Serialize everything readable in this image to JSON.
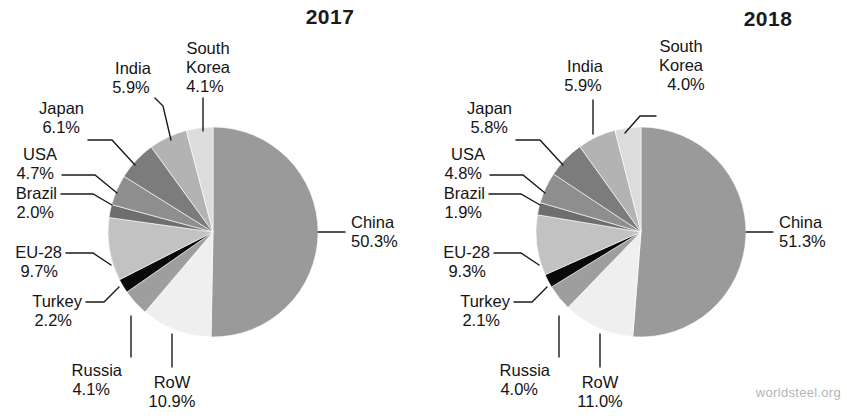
{
  "watermark": "worldsteel.org",
  "chart_data": [
    {
      "type": "pie",
      "title": "2017",
      "labels": [
        "China",
        "RoW",
        "Russia",
        "Turkey",
        "EU-28",
        "Brazil",
        "USA",
        "Japan",
        "India",
        "South Korea"
      ],
      "values": [
        50.3,
        10.9,
        4.1,
        2.2,
        9.7,
        2.0,
        4.7,
        6.1,
        5.9,
        4.1
      ],
      "value_labels": [
        "50.3%",
        "10.9%",
        "4.1%",
        "2.2%",
        "9.7%",
        "2.0%",
        "4.7%",
        "6.1%",
        "5.9%",
        "4.1%"
      ],
      "colors": [
        "#9a9a9a",
        "#efefef",
        "#9e9e9e",
        "#0a0a0a",
        "#c2c2c2",
        "#6e6e6e",
        "#8e8e8e",
        "#7c7c7c",
        "#b3b3b3",
        "#dcdcdc"
      ],
      "start_angle": 0,
      "direction": "clockwise",
      "legend": "none",
      "grid": false
    },
    {
      "type": "pie",
      "title": "2018",
      "labels": [
        "China",
        "RoW",
        "Russia",
        "Turkey",
        "EU-28",
        "Brazil",
        "USA",
        "Japan",
        "India",
        "South Korea"
      ],
      "values": [
        51.3,
        11.0,
        4.0,
        2.1,
        9.3,
        1.9,
        4.8,
        5.8,
        5.9,
        4.0
      ],
      "value_labels": [
        "51.3%",
        "11.0%",
        "4.0%",
        "2.1%",
        "9.3%",
        "1.9%",
        "4.8%",
        "5.8%",
        "5.9%",
        "4.0%"
      ],
      "colors": [
        "#9a9a9a",
        "#efefef",
        "#9e9e9e",
        "#0a0a0a",
        "#c2c2c2",
        "#6e6e6e",
        "#8e8e8e",
        "#7c7c7c",
        "#b3b3b3",
        "#dcdcdc"
      ],
      "start_angle": 0,
      "direction": "clockwise",
      "legend": "none",
      "grid": false
    }
  ],
  "left_chart": {
    "title": "2017",
    "labels": {
      "china_name": "China",
      "china_pct": "50.3%",
      "row_name": "RoW",
      "row_pct": "10.9%",
      "russia_name": "Russia",
      "russia_pct": "4.1%",
      "turkey_name": "Turkey",
      "turkey_pct": "2.2%",
      "eu_name": "EU-28",
      "eu_pct": "9.7%",
      "brazil_name": "Brazil",
      "brazil_pct": "2.0%",
      "usa_name": "USA",
      "usa_pct": "4.7%",
      "japan_name": "Japan",
      "japan_pct": "6.1%",
      "india_name": "India",
      "india_pct": "5.9%",
      "korea_name1": "South",
      "korea_name2": "Korea",
      "korea_pct": "4.1%"
    }
  },
  "right_chart": {
    "title": "2018",
    "labels": {
      "china_name": "China",
      "china_pct": "51.3%",
      "row_name": "RoW",
      "row_pct": "11.0%",
      "russia_name": "Russia",
      "russia_pct": "4.0%",
      "turkey_name": "Turkey",
      "turkey_pct": "2.1%",
      "eu_name": "EU-28",
      "eu_pct": "9.3%",
      "brazil_name": "Brazil",
      "brazil_pct": "1.9%",
      "usa_name": "USA",
      "usa_pct": "4.8%",
      "japan_name": "Japan",
      "japan_pct": "5.8%",
      "india_name": "India",
      "india_pct": "5.9%",
      "korea_name1": "South",
      "korea_name2": "Korea",
      "korea_pct": "4.0%"
    }
  }
}
